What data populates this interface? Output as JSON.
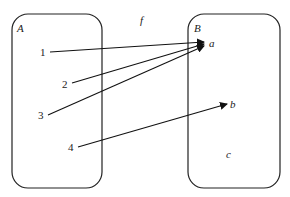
{
  "diagram": {
    "function_label": "f",
    "domain_set": {
      "name": "A",
      "elements": [
        "1",
        "2",
        "3",
        "4"
      ]
    },
    "codomain_set": {
      "name": "B",
      "elements": [
        "a",
        "b",
        "c"
      ]
    },
    "mappings": [
      {
        "from": "1",
        "to": "a"
      },
      {
        "from": "2",
        "to": "a"
      },
      {
        "from": "3",
        "to": "a"
      },
      {
        "from": "4",
        "to": "b"
      }
    ],
    "colors": {
      "stroke": "#222222",
      "background": "#ffffff"
    }
  }
}
